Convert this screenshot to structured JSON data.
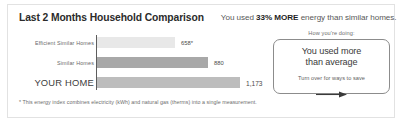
{
  "card": {
    "accent_dark": "#5d5d5d",
    "border_color": "#e2e2e2"
  },
  "header": {
    "title": "Last 2 Months Household Comparison",
    "subtitle_prefix": "You used ",
    "subtitle_highlight": "33% MORE",
    "subtitle_suffix": " energy than similar homes."
  },
  "callout": {
    "caption": "How you're doing:",
    "main_line1": "You used more",
    "main_line2": "than average",
    "sub": "Turn over for ways to save",
    "arrow_icon": "arrow-right-icon"
  },
  "footnote": "* This energy index combines electricity (kWh) and natural gas (therms) into a single measurement.",
  "chart_data": {
    "type": "bar",
    "orientation": "horizontal",
    "title": "Last 2 Months Household Comparison",
    "xlabel": "",
    "ylabel": "",
    "grid": false,
    "legend": "none",
    "xlim": [
      0,
      1450
    ],
    "categories": [
      "Efficient Similar Homes",
      "Similar Homes",
      "YOUR HOME"
    ],
    "values": [
      658,
      880,
      1173
    ],
    "value_labels": [
      "658*",
      "880",
      "1,173"
    ],
    "colors": [
      "#e8e8e8",
      "#a8a8a8",
      "#bdbdbd"
    ],
    "bar_widths_px": [
      78,
      111,
      143
    ]
  }
}
